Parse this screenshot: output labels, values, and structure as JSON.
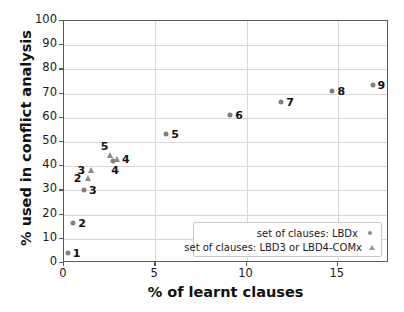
{
  "chart_data": {
    "type": "scatter",
    "title": "",
    "xlabel": "% of learnt clauses",
    "ylabel": "% used in conflict analysis",
    "xlim": [
      0,
      17.8
    ],
    "ylim": [
      0,
      100
    ],
    "xticks": [
      "0",
      "5",
      "10",
      "15"
    ],
    "xtick_values": [
      0,
      5,
      10,
      15
    ],
    "yticks": [
      "0",
      "10",
      "20",
      "30",
      "40",
      "50",
      "60",
      "70",
      "80",
      "90",
      "100"
    ],
    "ytick_values": [
      0,
      10,
      20,
      30,
      40,
      50,
      60,
      70,
      80,
      90,
      100
    ],
    "grid": true,
    "legend_position": "lower right",
    "marker_color": "#7f7f7f",
    "series": [
      {
        "name": "set of clauses: LBDx",
        "marker": "circle",
        "points": [
          {
            "label": "1",
            "x": 0.2,
            "y": 4.0,
            "label_side": "right"
          },
          {
            "label": "2",
            "x": 0.5,
            "y": 16.5,
            "label_side": "right"
          },
          {
            "label": "3",
            "x": 1.1,
            "y": 30.0,
            "label_side": "right"
          },
          {
            "label": "4",
            "x": 2.7,
            "y": 42.0,
            "label_side": "below"
          },
          {
            "label": "5",
            "x": 5.6,
            "y": 53.5,
            "label_side": "right"
          },
          {
            "label": "6",
            "x": 9.1,
            "y": 61.0,
            "label_side": "right"
          },
          {
            "label": "7",
            "x": 11.9,
            "y": 66.5,
            "label_side": "right"
          },
          {
            "label": "8",
            "x": 14.7,
            "y": 71.0,
            "label_side": "right"
          },
          {
            "label": "9",
            "x": 16.9,
            "y": 73.5,
            "label_side": "right"
          }
        ]
      },
      {
        "name": "set of clauses: LBD3 or LBD4-COMx",
        "marker": "triangle",
        "points": [
          {
            "label": "2",
            "x": 1.3,
            "y": 35.0,
            "label_side": "left"
          },
          {
            "label": "3",
            "x": 1.5,
            "y": 38.5,
            "label_side": "left"
          },
          {
            "label": "4",
            "x": 2.9,
            "y": 43.0,
            "label_side": "right"
          },
          {
            "label": "5",
            "x": 2.5,
            "y": 44.5,
            "label_side": "above-left"
          }
        ]
      }
    ]
  },
  "legend": {
    "items": [
      {
        "label": "set of clauses: LBDx",
        "marker": "circle-icon"
      },
      {
        "label": "set of clauses: LBD3 or LBD4-COMx",
        "marker": "triangle-icon"
      }
    ]
  }
}
